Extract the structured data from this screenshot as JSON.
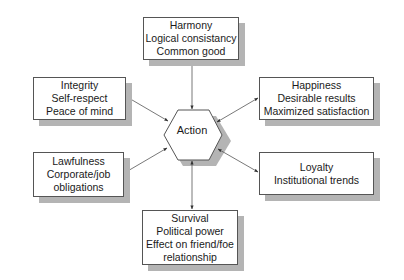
{
  "center": {
    "label": "Action"
  },
  "nodes": {
    "top": {
      "lines": [
        "Harmony",
        "Logical consistancy",
        "Common good"
      ]
    },
    "upper_left": {
      "lines": [
        "Integrity",
        "Self-respect",
        "Peace of mind"
      ]
    },
    "upper_right": {
      "lines": [
        "Happiness",
        "Desirable results",
        "Maximized satisfaction"
      ]
    },
    "lower_left": {
      "lines": [
        "Lawfulness",
        "Corporate/job",
        "obligations"
      ]
    },
    "lower_right": {
      "lines": [
        "Loyalty",
        "Institutional trends"
      ]
    },
    "bottom": {
      "lines": [
        "Survival",
        "Political power",
        "Effect on friend/foe",
        "relationship"
      ]
    }
  },
  "colors": {
    "line": "#555555",
    "shadow": "#b4b4b4",
    "box_fill": "#ffffff"
  }
}
